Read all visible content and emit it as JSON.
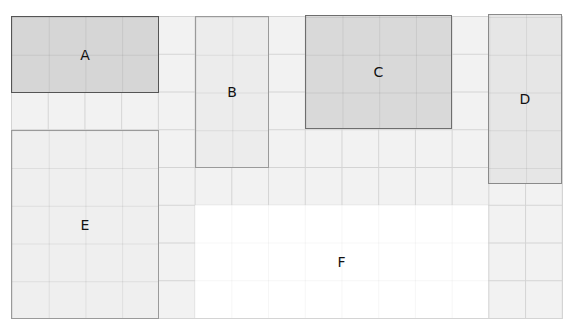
{
  "diagram": {
    "grid": {
      "columns": 15,
      "rows": 8
    },
    "blocks": [
      {
        "label": "A",
        "left": 11,
        "top": 16,
        "width": 148,
        "height": 77,
        "fill": "#d6d6d6",
        "border": "#555555",
        "border_width": 1.5
      },
      {
        "label": "B",
        "left": 195,
        "top": 16,
        "width": 74,
        "height": 152,
        "fill": "#ececec",
        "border": "#9a9a9a",
        "border_width": 1
      },
      {
        "label": "C",
        "left": 305,
        "top": 15,
        "width": 147,
        "height": 114,
        "fill": "#d9d9d9",
        "border": "#6e6e6e",
        "border_width": 1.5
      },
      {
        "label": "D",
        "left": 488,
        "top": 14,
        "width": 74,
        "height": 170,
        "fill": "#e6e6e6",
        "border": "#8a8a8a",
        "border_width": 1.5
      },
      {
        "label": "E",
        "left": 11,
        "top": 130,
        "width": 148,
        "height": 189,
        "fill": "#efefef",
        "border": "#9a9a9a",
        "border_width": 1
      },
      {
        "label": "F",
        "left": 195,
        "top": 205,
        "width": 293,
        "height": 113,
        "fill": "#ffffff",
        "border": "transparent",
        "border_width": 0
      }
    ]
  }
}
